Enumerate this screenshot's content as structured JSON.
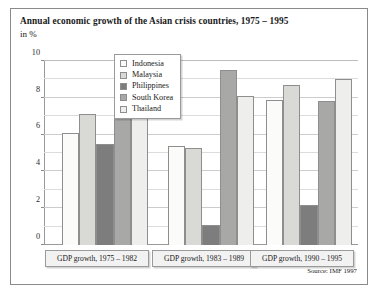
{
  "figure": {
    "title": "Annual economic growth of the Asian crisis countries, 1975 – 1995",
    "subtitle": "in %",
    "source": "Source: IMF 1997"
  },
  "legend": {
    "position": "top-center-inside",
    "items": [
      {
        "label": "Indonesia",
        "color": "#fbfbfa"
      },
      {
        "label": "Malaysia",
        "color": "#d9d9d6"
      },
      {
        "label": "Philippines",
        "color": "#7d7d7d"
      },
      {
        "label": "South Korea",
        "color": "#a8a8a6"
      },
      {
        "label": "Thailand",
        "color": "#eeeeec"
      }
    ]
  },
  "axis": {
    "y_ticks_major": [
      "0",
      "2",
      "4",
      "6",
      "8",
      "10"
    ],
    "y_minor_step": 1
  },
  "chart_data": {
    "type": "bar",
    "title": "Annual economic growth of the Asian crisis countries, 1975 – 1995",
    "subtitle": "in %",
    "xlabel": "",
    "ylabel": "in %",
    "ylim": [
      0,
      10
    ],
    "ytick_step": 2,
    "yminor_step": 1,
    "grid": true,
    "legend_position": "top-center-inside",
    "categories": [
      "GDP growth, 1975 – 1982",
      "GDP growth, 1983 – 1989",
      "GDP growth, 1990 – 1995"
    ],
    "series": [
      {
        "name": "Indonesia",
        "color": "#fbfbfa",
        "values": [
          6.1,
          5.4,
          7.9
        ]
      },
      {
        "name": "Malaysia",
        "color": "#d9d9d6",
        "values": [
          7.1,
          5.25,
          8.7
        ]
      },
      {
        "name": "Philippines",
        "color": "#7d7d7d",
        "values": [
          5.5,
          1.1,
          2.2
        ]
      },
      {
        "name": "South Korea",
        "color": "#a8a8a6",
        "values": [
          7.0,
          9.5,
          7.8
        ]
      },
      {
        "name": "Thailand",
        "color": "#eeeeec",
        "values": [
          7.0,
          8.1,
          9.0
        ]
      }
    ],
    "source": "Source: IMF 1997"
  }
}
